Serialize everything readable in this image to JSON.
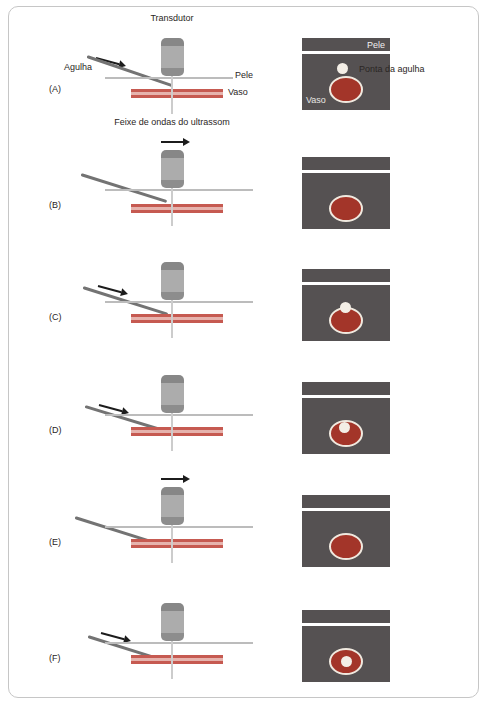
{
  "diagram": {
    "labels": {
      "transducer": "Transdutor",
      "needle": "Agulha",
      "skin": "Pele",
      "vessel": "Vaso",
      "beam": "Feixe de ondas do ultrassom"
    },
    "panel_labels": {
      "skin": "Pele",
      "needle_tip": "Ponta da agulha",
      "vessel": "Vaso"
    },
    "rows": [
      {
        "label": "(A)",
        "arrow": "needle-advance",
        "tip_in_view": true,
        "tip_location": "above-vessel"
      },
      {
        "label": "(B)",
        "arrow": "transducer-slide",
        "tip_in_view": false,
        "tip_location": "none"
      },
      {
        "label": "(C)",
        "arrow": "needle-advance",
        "tip_in_view": true,
        "tip_location": "vessel-top-edge"
      },
      {
        "label": "(D)",
        "arrow": "needle-advance",
        "tip_in_view": true,
        "tip_location": "inside-vessel-upper"
      },
      {
        "label": "(E)",
        "arrow": "transducer-slide",
        "tip_in_view": false,
        "tip_location": "none"
      },
      {
        "label": "(F)",
        "arrow": "needle-advance",
        "tip_in_view": true,
        "tip_location": "vessel-center"
      }
    ],
    "colors": {
      "ultrasound_background": "#555152",
      "vessel_red": "#a33529",
      "vessel_outline_white": "#f0e9df",
      "vessel_band_red": "#c65a51",
      "vessel_band_fill": "#e6b3ad",
      "needle_gray": "#737373",
      "skin_line_gray": "#bcbcbc",
      "transducer_gray": "#acacac"
    }
  }
}
